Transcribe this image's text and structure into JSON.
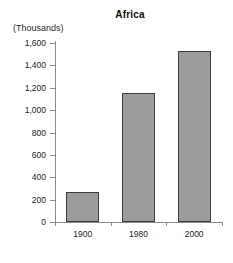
{
  "chart_data": {
    "type": "bar",
    "title": "Africa",
    "xlabel": "",
    "ylabel": "(Thousands)",
    "categories": [
      "1900",
      "1980",
      "2000"
    ],
    "values": [
      265,
      1150,
      1530
    ],
    "series": [
      {
        "name": "Africa",
        "values": [
          265,
          1150,
          1530
        ]
      }
    ],
    "ylim": [
      0,
      1600
    ],
    "ytick_values": [
      0,
      200,
      400,
      600,
      800,
      1000,
      1200,
      1400,
      1600
    ],
    "ytick_labels": [
      "0",
      "200",
      "400",
      "600",
      "800",
      "1,000",
      "1,200",
      "1,400",
      "1,600"
    ],
    "grid": false,
    "legend": false,
    "bar_color": "#9b9b9b",
    "bar_border_color": "#3d3d3d",
    "axis_color": "#8c8c8c",
    "background": "#ffffff"
  }
}
